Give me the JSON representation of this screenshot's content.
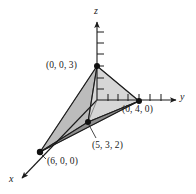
{
  "figure": {
    "kind": "3d-coordinate-diagram",
    "background_color": "#ffffff",
    "line_color": "#1a1a1a",
    "axes": [
      {
        "name": "x",
        "label": "x",
        "direction": "lower-left"
      },
      {
        "name": "y",
        "label": "y",
        "direction": "right"
      },
      {
        "name": "z",
        "label": "z",
        "direction": "up"
      }
    ],
    "axis_labels": {
      "x": "x",
      "y": "y",
      "z": "z"
    },
    "vertices": [
      {
        "name": "z-vertex",
        "label": "(0, 0, 3)",
        "coords": [
          0,
          0,
          3
        ],
        "px": [
          97,
          66
        ]
      },
      {
        "name": "y-vertex",
        "label": "(0, 4, 0)",
        "coords": [
          0,
          4,
          0
        ],
        "px": [
          139,
          101
        ]
      },
      {
        "name": "x-vertex",
        "label": "(6, 0, 0)",
        "coords": [
          6,
          0,
          0
        ],
        "px": [
          40,
          152
        ]
      },
      {
        "name": "interior-vertex",
        "label": "(5, 3, 2)",
        "coords": [
          5,
          3,
          2
        ],
        "px": [
          88,
          122
        ]
      }
    ],
    "face_colors": {
      "upper_right": "#d4d4d4",
      "left": "#bdbdbd",
      "lower_front": "#a8a8a8",
      "bottom": "#8f8f8f"
    },
    "tick_counts": {
      "z_axis": 6,
      "y_axis": 7
    }
  }
}
